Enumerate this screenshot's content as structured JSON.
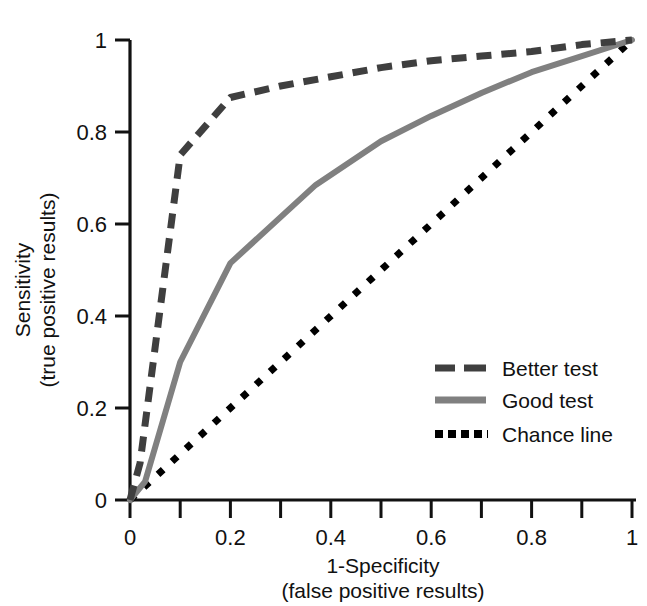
{
  "chart_data": {
    "type": "line",
    "title": "",
    "xlabel": "1-Specificity",
    "xlabel_sub": "(false positive results)",
    "ylabel": "Sensitivity",
    "ylabel_sub": "(true positive results)",
    "xlim": [
      0,
      1
    ],
    "ylim": [
      0,
      1
    ],
    "grid": false,
    "legend_position": "lower right",
    "xticks": [
      0,
      0.2,
      0.4,
      0.6,
      0.8,
      1
    ],
    "xtick_labels": [
      "0",
      "0.2",
      "0.4",
      "0.6",
      "0.8",
      "1"
    ],
    "xminor_ticks": [
      0.1,
      0.3,
      0.5,
      0.7,
      0.9
    ],
    "yticks": [
      0,
      0.2,
      0.4,
      0.6,
      0.8,
      1
    ],
    "ytick_labels": [
      "0",
      "0.2",
      "0.4",
      "0.6",
      "0.8",
      "1"
    ],
    "series": [
      {
        "name": "Better test",
        "style": "dashed",
        "color": "#3f3f3f",
        "width": 7,
        "x": [
          0,
          0.02,
          0.1,
          0.2,
          0.3,
          0.4,
          0.5,
          0.6,
          0.7,
          0.8,
          0.9,
          1
        ],
        "y": [
          0,
          0.08,
          0.75,
          0.875,
          0.9,
          0.92,
          0.94,
          0.955,
          0.965,
          0.975,
          0.99,
          1
        ]
      },
      {
        "name": "Good test",
        "style": "solid",
        "color": "#808080",
        "width": 6,
        "x": [
          0,
          0.03,
          0.1,
          0.2,
          0.37,
          0.5,
          0.6,
          0.7,
          0.8,
          0.9,
          1
        ],
        "y": [
          0,
          0.04,
          0.3,
          0.515,
          0.685,
          0.78,
          0.835,
          0.885,
          0.93,
          0.965,
          1
        ]
      },
      {
        "name": "Chance line",
        "style": "dotted",
        "color": "#000000",
        "width": 7,
        "x": [
          0,
          1
        ],
        "y": [
          0,
          1
        ]
      }
    ],
    "legend": [
      {
        "label": "Better test",
        "style": "dashed",
        "color": "#3f3f3f"
      },
      {
        "label": "Good test",
        "style": "solid",
        "color": "#808080"
      },
      {
        "label": "Chance line",
        "style": "dotted",
        "color": "#000000"
      }
    ],
    "axis_color": "#111111"
  }
}
